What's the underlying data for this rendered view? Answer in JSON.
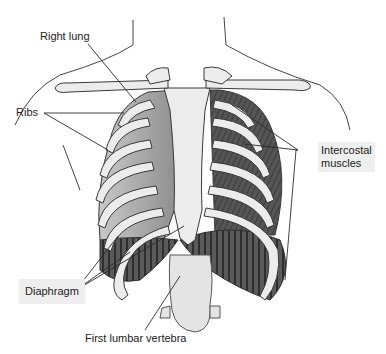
{
  "figure": {
    "labels": {
      "right_lung": "Right lung",
      "ribs": "Ribs",
      "intercostal_muscles_line1": "Intercostal",
      "intercostal_muscles_line2": "muscles",
      "diaphragm": "Diaphragm",
      "first_lumbar_vertebra": "First lumbar vertebra"
    },
    "colors": {
      "bone": "#ececec",
      "outline": "#3a3a3a",
      "lung": "#a9a9a9",
      "muscle": "#4a4a4a",
      "label_box": "#eeeeee"
    }
  }
}
